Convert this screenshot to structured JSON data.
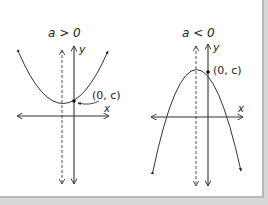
{
  "figure": {
    "left_panel": {
      "condition_label": "a > 0",
      "point_label": "(0, c)",
      "x_axis_label": "x",
      "y_axis_label": "y",
      "opens": "up"
    },
    "right_panel": {
      "condition_label": "a < 0",
      "point_label": "(0, c)",
      "x_axis_label": "x",
      "y_axis_label": "y",
      "opens": "down"
    }
  }
}
